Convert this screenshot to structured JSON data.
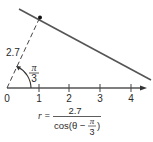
{
  "diagram": {
    "type": "polar-line",
    "line_color": "#555555",
    "axis_ticks": [
      {
        "label": "0",
        "x": 7
      },
      {
        "label": "1",
        "x": 39
      },
      {
        "label": "2",
        "x": 69
      },
      {
        "label": "3",
        "x": 100
      },
      {
        "label": "4",
        "x": 131
      }
    ],
    "distance_label": "2.7",
    "angle_label": {
      "numerator": "π",
      "denominator": "3"
    },
    "equation": {
      "lhs": "r =",
      "numerator": "2.7",
      "denominator_prefix": "cos(θ −",
      "denominator_frac_num": "π",
      "denominator_frac_den": "3",
      "denominator_suffix": ")"
    }
  }
}
